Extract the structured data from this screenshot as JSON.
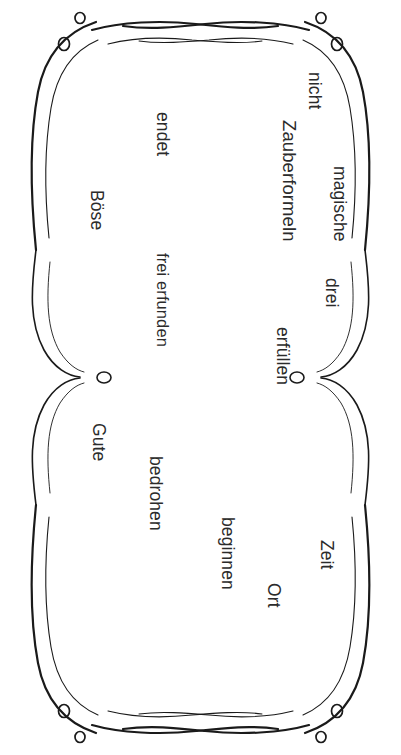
{
  "page": {
    "orientation": "landscape-rotated-90",
    "background_color": "#ffffff",
    "ink_color": "#2b2b2b",
    "width_px": 401,
    "height_px": 755
  },
  "frame": {
    "name": "ornamental-swirl-border",
    "style": "hand-drawn calligraphic flourish",
    "corner_count": 4,
    "circles_per_corner": 2,
    "edge_accent_circles": 2,
    "stroke_color": "#1a1a1a"
  },
  "words": [
    {
      "id": "magische",
      "text": "magische",
      "size": "med"
    },
    {
      "id": "zauberformeln",
      "text": "Zauberformeln",
      "size": "big"
    },
    {
      "id": "nicht",
      "text": "nicht",
      "size": "med"
    },
    {
      "id": "drei",
      "text": "drei",
      "size": "med"
    },
    {
      "id": "erfuellen",
      "text": "erfüllen",
      "size": "med"
    },
    {
      "id": "zeit",
      "text": "Zeit",
      "size": "med"
    },
    {
      "id": "ort",
      "text": "Ort",
      "size": "med"
    },
    {
      "id": "beginnen",
      "text": "beginnen",
      "size": "med"
    },
    {
      "id": "endet",
      "text": "endet",
      "size": "med"
    },
    {
      "id": "boese",
      "text": "Böse",
      "size": "med"
    },
    {
      "id": "frei_erfunden",
      "text": "frei erfunden",
      "size": "sm"
    },
    {
      "id": "gute",
      "text": "Gute",
      "size": "med"
    },
    {
      "id": "bedrohen",
      "text": "bedrohen",
      "size": "med"
    }
  ]
}
